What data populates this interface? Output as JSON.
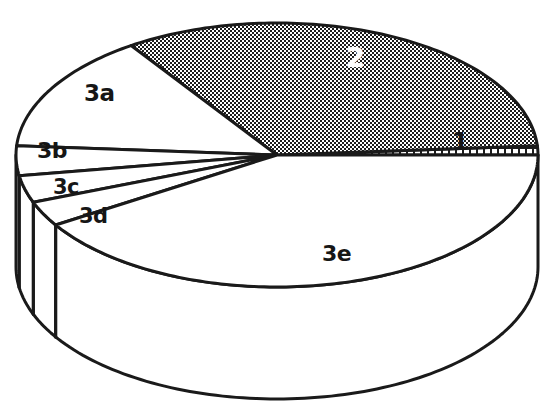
{
  "chart_data": {
    "type": "pie",
    "title": "",
    "subtitle": "",
    "xlabel": "",
    "ylabel": "",
    "style": "3d-exploded-none",
    "legend_position": "none",
    "grid": false,
    "categories": [
      "1",
      "2",
      "3a",
      "3b",
      "3c",
      "3d",
      "3e"
    ],
    "values": [
      1.1,
      33.3,
      14.4,
      5.6,
      4.2,
      3.1,
      38.3
    ],
    "labels_drawn_on_slices": true,
    "slices": [
      {
        "label": "1",
        "value": 1.1,
        "start_angle_deg": 0,
        "end_angle_deg": 4,
        "fill_pattern": "coarse-grid-hatch",
        "fill_tone": "light",
        "label_color": "#161616",
        "label_x": 452,
        "label_y": 132
      },
      {
        "label": "2",
        "value": 33.3,
        "start_angle_deg": 4,
        "end_angle_deg": 124,
        "fill_pattern": "dense-checker-dither",
        "fill_tone": "dark",
        "label_color": "#ffffff",
        "label_x": 346,
        "label_y": 44
      },
      {
        "label": "3a",
        "value": 14.4,
        "start_angle_deg": 124,
        "end_angle_deg": 176,
        "fill_pattern": "solid",
        "fill_tone": "white",
        "label_color": "#161616",
        "label_x": 84,
        "label_y": 82
      },
      {
        "label": "3b",
        "value": 5.6,
        "start_angle_deg": 176,
        "end_angle_deg": 189,
        "fill_pattern": "solid",
        "fill_tone": "white",
        "label_color": "#161616",
        "label_x": 37,
        "label_y": 140
      },
      {
        "label": "3c",
        "value": 4.2,
        "start_angle_deg": 189,
        "end_angle_deg": 201,
        "fill_pattern": "solid",
        "fill_tone": "white",
        "label_color": "#161616",
        "label_x": 52,
        "label_y": 178
      },
      {
        "label": "3d",
        "value": 3.1,
        "start_angle_deg": 201,
        "end_angle_deg": 212,
        "fill_pattern": "solid",
        "fill_tone": "white",
        "label_color": "#161616",
        "label_x": 78,
        "label_y": 207
      },
      {
        "label": "3e",
        "value": 38.3,
        "start_angle_deg": 212,
        "end_angle_deg": 360,
        "fill_pattern": "solid",
        "fill_tone": "white",
        "label_color": "#161616",
        "label_x": 322,
        "label_y": 244
      }
    ],
    "geometry": {
      "center_x": 277,
      "center_y": 155,
      "radius_x": 261,
      "radius_y": 132,
      "depth": 112
    },
    "colors": {
      "outline": "#1a1a1a",
      "slice_white": "#ffffff",
      "slice_dark": "#4a4a4a",
      "slice_hatch": "#ffffff",
      "hatch_line": "#1c1c1c",
      "background": "#ffffff"
    }
  },
  "labels": {
    "one": "1",
    "two": "2",
    "three_a": "3a",
    "three_b": "3b",
    "three_c": "3c",
    "three_d": "3d",
    "three_e": "3e"
  }
}
